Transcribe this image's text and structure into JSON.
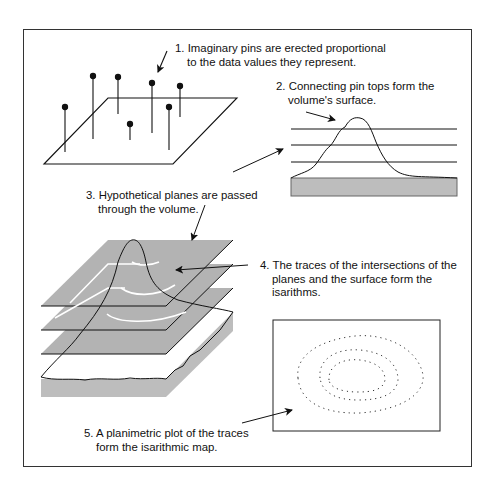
{
  "figure": {
    "steps": [
      {
        "number": "1.",
        "line1": "Imaginary pins are erected proportional",
        "line2": "to the data values they represent."
      },
      {
        "number": "2.",
        "line1": "Connecting pin tops form the",
        "line2": "volume's surface."
      },
      {
        "number": "3.",
        "line1": "Hypothetical planes are passed",
        "line2": "through the volume."
      },
      {
        "number": "4.",
        "line1": "The traces of the intersections of the",
        "line2": "planes and the surface form the",
        "line3": "isarithms."
      },
      {
        "number": "5.",
        "line1": "A planimetric plot of the traces",
        "line2": "form the isarithmic map."
      }
    ],
    "colors": {
      "line": "#111111",
      "plane_fill": "#b3b3b3",
      "base_fill": "#bdbdbd",
      "isarithm_on_plane": "#ffffff",
      "frame": "#333333"
    },
    "panels": {
      "pins": {
        "count": 8,
        "label": "pins-on-plane"
      },
      "profile": {
        "horizontal_planes": 3,
        "label": "surface-profile"
      },
      "stacked_planes": {
        "planes": 3,
        "label": "planes-through-volume"
      },
      "map": {
        "contours": 3,
        "style": "dotted",
        "label": "isarithmic-map"
      }
    }
  }
}
